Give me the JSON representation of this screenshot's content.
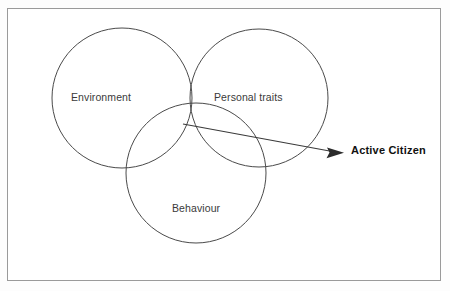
{
  "diagram": {
    "type": "venn",
    "title": "",
    "frame": {
      "border_color": "#9a9a9a",
      "background_color": "#ffffff"
    },
    "circles": [
      {
        "id": "environment",
        "label": "Environment",
        "cx": 122,
        "cy": 98,
        "r": 70,
        "stroke_color": "#4a4a4a",
        "label_x": 71,
        "label_y": 92
      },
      {
        "id": "personal-traits",
        "label": "Personal traits",
        "cx": 259,
        "cy": 98,
        "r": 69,
        "stroke_color": "#4a4a4a",
        "label_x": 214,
        "label_y": 92
      },
      {
        "id": "behaviour",
        "label": "Behaviour",
        "cx": 196,
        "cy": 173,
        "r": 70,
        "stroke_color": "#4a4a4a",
        "label_x": 172,
        "label_y": 203
      }
    ],
    "callout": {
      "label": "Active Citizen",
      "emphasis": "bold",
      "color": "#111111",
      "arrow": {
        "x1": 183,
        "y1": 124,
        "x2": 337,
        "y2": 152,
        "tip_x": 344,
        "tip_y": 153,
        "color": "#2b2b2b"
      },
      "label_x": 351,
      "label_y": 145
    }
  }
}
